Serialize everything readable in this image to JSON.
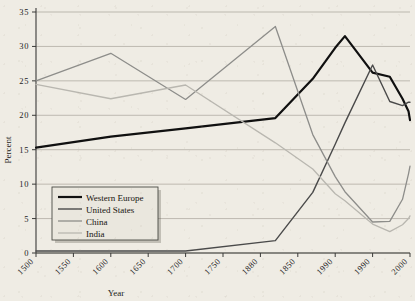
{
  "chart_data": {
    "type": "line",
    "title": "",
    "xlabel": "Year",
    "ylabel": "Percent",
    "xlim": [
      1500,
      2000
    ],
    "ylim": [
      0,
      35
    ],
    "grid": true,
    "legend_position": "bottom-left",
    "x_tick_labels": [
      "1500",
      "1550",
      "1600",
      "1650",
      "1700",
      "1750",
      "1880",
      "1850",
      "1990",
      "1990",
      "2000"
    ],
    "x_tick_values": [
      1500,
      1550,
      1600,
      1650,
      1700,
      1750,
      1800,
      1850,
      1900,
      1950,
      2000
    ],
    "y_tick_labels": [
      "0",
      "5",
      "10",
      "15",
      "20",
      "25",
      "30",
      "35"
    ],
    "y_tick_values": [
      0,
      5,
      10,
      15,
      20,
      25,
      30,
      35
    ],
    "series": [
      {
        "name": "Western Europe",
        "color": "#101010",
        "width": 2.2,
        "x": [
          1500,
          1600,
          1700,
          1820,
          1870,
          1900,
          1913,
          1950,
          1973,
          1990,
          1998,
          2000
        ],
        "values": [
          15.3,
          16.9,
          18.1,
          19.6,
          25.3,
          29.8,
          31.5,
          26.2,
          25.6,
          22.4,
          20.6,
          19.3
        ]
      },
      {
        "name": "United States",
        "color": "#4a4a4a",
        "width": 1.4,
        "x": [
          1500,
          1600,
          1700,
          1820,
          1870,
          1900,
          1913,
          1950,
          1973,
          1990,
          1998,
          2000
        ],
        "values": [
          0.3,
          0.3,
          0.3,
          1.8,
          8.8,
          15.8,
          18.9,
          27.3,
          22.0,
          21.4,
          21.9,
          21.9
        ]
      },
      {
        "name": "China",
        "color": "#8d8d8a",
        "width": 1.3,
        "x": [
          1500,
          1600,
          1700,
          1820,
          1870,
          1900,
          1913,
          1950,
          1973,
          1990,
          1998,
          2000
        ],
        "values": [
          25.0,
          29.0,
          22.3,
          32.9,
          17.2,
          11.1,
          8.9,
          4.5,
          4.6,
          7.8,
          11.5,
          12.6
        ]
      },
      {
        "name": "India",
        "color": "#b9b7b0",
        "width": 1.3,
        "x": [
          1500,
          1600,
          1700,
          1820,
          1870,
          1900,
          1913,
          1950,
          1973,
          1990,
          1998,
          2000
        ],
        "values": [
          24.5,
          22.4,
          24.4,
          16.0,
          12.2,
          8.6,
          7.6,
          4.2,
          3.1,
          4.1,
          5.0,
          5.4
        ]
      }
    ]
  },
  "legend": {
    "items": [
      {
        "label": "Western Europe"
      },
      {
        "label": "United States"
      },
      {
        "label": "China"
      },
      {
        "label": "India"
      }
    ]
  }
}
